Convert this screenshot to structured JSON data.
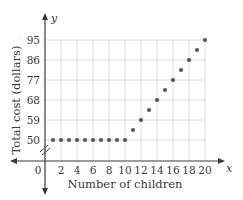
{
  "chart_data": {
    "type": "scatter",
    "title": "",
    "xlabel": "Number of children",
    "ylabel": "Total cost (dollars)",
    "x_axis_var": "x",
    "y_axis_var": "y",
    "x_ticks": [
      "0",
      "2",
      "4",
      "6",
      "8",
      "10",
      "12",
      "14",
      "16",
      "18",
      "20"
    ],
    "y_ticks": [
      "50",
      "59",
      "68",
      "77",
      "86",
      "95"
    ],
    "xlim": [
      0,
      20
    ],
    "ylim": [
      50,
      95
    ],
    "y_axis_break": true,
    "grid": true,
    "legend": null,
    "x": [
      1,
      2,
      3,
      4,
      5,
      6,
      7,
      8,
      9,
      10,
      11,
      12,
      13,
      14,
      15,
      16,
      17,
      18,
      19,
      20
    ],
    "values": [
      50,
      50,
      50,
      50,
      50,
      50,
      50,
      50,
      50,
      50,
      54.5,
      59,
      63.5,
      68,
      72.5,
      77,
      81.5,
      86,
      90.5,
      95
    ],
    "colors": {
      "points": "#555555",
      "axes": "#3a3a3a",
      "grid": "#dcdcdc"
    }
  }
}
